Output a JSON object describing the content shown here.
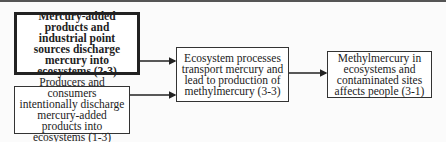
{
  "diagram": {
    "nodes": [
      {
        "id": "b1",
        "label": "Mercury-added products and industrial point sources discharge mercury into ecosystems (2-3)",
        "emphasis": "bold"
      },
      {
        "id": "b2",
        "label": "Producers and consumers intentionally discharge mercury-added products into ecosystems (1-3)"
      },
      {
        "id": "b3",
        "label": "Ecosystem processes transport mercury and lead to production of methylmercury (3-3)"
      },
      {
        "id": "b4",
        "label": "Methylmercury in ecosystems and contaminated sites affects people (3-1)"
      }
    ],
    "edges": [
      {
        "from": "b1",
        "to": "b3"
      },
      {
        "from": "b2",
        "to": "b3"
      },
      {
        "from": "b3",
        "to": "b4"
      }
    ]
  }
}
